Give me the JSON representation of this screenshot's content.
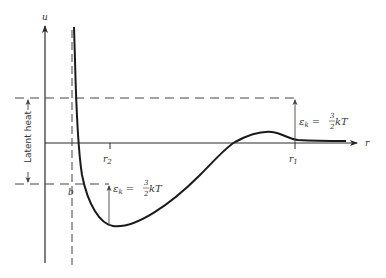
{
  "diagram": {
    "axes": {
      "y_label": "u",
      "x_label": "r"
    },
    "markers": {
      "r2": "r",
      "r2_sub": "2",
      "r1": "r",
      "r1_sub": "1",
      "b": "b"
    },
    "annotations": {
      "latent_heat": "Latent heat",
      "ek_upper": {
        "eps": "ε",
        "sub": "k",
        "eq": " = ",
        "num": "3",
        "den": "2",
        "rest": " kT"
      },
      "ek_lower": {
        "eps": "ε",
        "sub": "k",
        "eq": " = ",
        "num": "3",
        "den": "2",
        "rest": " kT"
      }
    },
    "colors": {
      "line": "#2a2a2a",
      "curve": "#1a1a1a",
      "background": "#ffffff"
    }
  }
}
